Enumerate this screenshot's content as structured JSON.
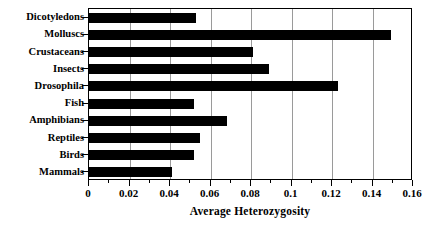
{
  "chart_data": {
    "type": "bar",
    "orientation": "horizontal",
    "title": "",
    "xlabel": "Average Heterozygosity",
    "ylabel": "",
    "xlim": [
      0,
      0.16
    ],
    "xticks": [
      "0",
      "0.02",
      "0.04",
      "0.06",
      "0.08",
      "0.1",
      "0.12",
      "0.14",
      "0.16"
    ],
    "xtick_values": [
      0,
      0.02,
      0.04,
      0.06,
      0.08,
      0.1,
      0.12,
      0.14,
      0.16
    ],
    "minor_ticks": true,
    "grid": "vertical",
    "legend": "none",
    "bar_color": "#000000",
    "categories": [
      "Dicotyledons",
      "Molluscs",
      "Crustaceans",
      "Insects",
      "Drosophila",
      "Fish",
      "Amphibians",
      "Reptiles",
      "Birds",
      "Mammals"
    ],
    "values": [
      0.053,
      0.149,
      0.081,
      0.089,
      0.123,
      0.052,
      0.068,
      0.055,
      0.052,
      0.041
    ]
  }
}
